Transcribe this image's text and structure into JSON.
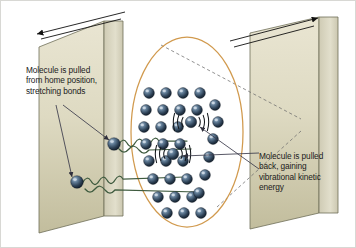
{
  "diagram": {
    "background_color": "#ffffff",
    "border_color": "#d8d8d4"
  },
  "annotations": {
    "left": {
      "text": "Molecule is pulled\nfrom home position,\nstretching bonds",
      "name": "left-annotation"
    },
    "right": {
      "text": "Molecule is pulled\nback, gaining\nvibrational kinetic\nenergy",
      "name": "right-annotation"
    }
  },
  "walls": {
    "face_color_top": "#e6e2cd",
    "face_color_bottom": "#c3bfa0",
    "edge_color": "#d8d5bf",
    "stroke": "#6f6e58",
    "left_label": "left-wall",
    "right_label": "right-wall"
  },
  "motion_arrows": {
    "color": "#111111",
    "left_direction": "left-outward",
    "right_direction": "right-outward",
    "count": 2
  },
  "oval": {
    "stroke": "#d19a4e",
    "cx": 186,
    "cy": 131,
    "rx": 56,
    "ry": 95
  },
  "dashed_lines": {
    "color": "#6c6c6c",
    "count": 2
  },
  "springs": {
    "color": "#3f5b3f",
    "count": 2,
    "description": "coiled stretched bonds"
  },
  "molecules": {
    "sphere_color_light": "#8fa7bd",
    "sphere_color_dark": "#1d2d3f",
    "radius": 5.4,
    "grid_points": [
      [
        148,
        92
      ],
      [
        165,
        92
      ],
      [
        182,
        92
      ],
      [
        199,
        92
      ],
      [
        145,
        109
      ],
      [
        162,
        109
      ],
      [
        179,
        109
      ],
      [
        196,
        109
      ],
      [
        143,
        126
      ],
      [
        160,
        126
      ],
      [
        177,
        126
      ],
      [
        145,
        143
      ],
      [
        162,
        143
      ],
      [
        179,
        143
      ],
      [
        148,
        160
      ],
      [
        165,
        160
      ],
      [
        182,
        160
      ],
      [
        152,
        178
      ],
      [
        169,
        178
      ],
      [
        186,
        178
      ],
      [
        157,
        196
      ],
      [
        174,
        196
      ],
      [
        191,
        196
      ],
      [
        166,
        212
      ],
      [
        183,
        212
      ],
      [
        200,
        212
      ],
      [
        214,
        104
      ],
      [
        217,
        121
      ],
      [
        212,
        138
      ],
      [
        208,
        156
      ],
      [
        204,
        174
      ],
      [
        198,
        192
      ]
    ],
    "pulled_out": [
      [
        113,
        143
      ],
      [
        76,
        181
      ]
    ],
    "vibrating": [
      [
        190,
        121
      ],
      [
        172,
        153
      ]
    ]
  },
  "vibration_glyph": {
    "name": "vibration-arcs",
    "arc_color": "#14181c",
    "arcs_per_side": 3
  },
  "pointer_arrows": {
    "color": "#3a3a4a",
    "left_count": 2,
    "right_count": 2
  }
}
